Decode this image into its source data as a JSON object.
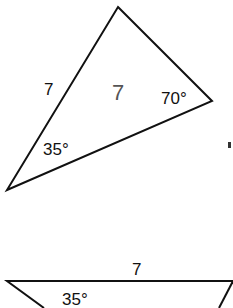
{
  "triangle_top": {
    "side_label": "7",
    "center_label": "7",
    "angle_right": "70°",
    "angle_bottom_left": "35°"
  },
  "triangle_bottom": {
    "side_label": "7",
    "angle_left": "35°"
  },
  "colors": {
    "stroke": "#111111",
    "center_label": "#555555"
  }
}
